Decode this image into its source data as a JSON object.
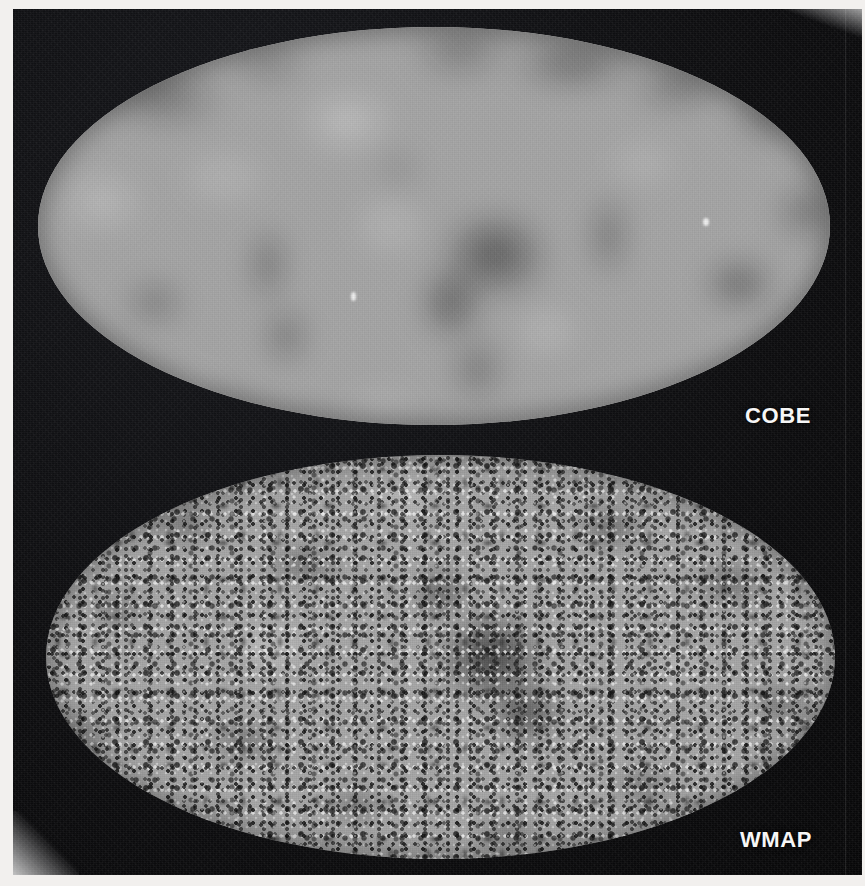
{
  "figure": {
    "width": 865,
    "height": 886,
    "background_color": "#0d0d0e",
    "page_color": "#f2f0ee"
  },
  "maps": [
    {
      "id": "cobe",
      "label": "COBE",
      "projection": "mollweide-ellipse",
      "appearance": "smooth low-resolution blurred grayscale all-sky temperature map",
      "base_color": "#9b9b9b",
      "dark_color": "#4f4f4f",
      "bright_color": "#c2c2c2"
    },
    {
      "id": "wmap",
      "label": "WMAP",
      "projection": "mollweide-ellipse",
      "appearance": "fine-grained high-resolution speckled grayscale all-sky temperature map",
      "base_color": "#a3a3a3",
      "dark_color": "#141414",
      "bright_color": "#ececec"
    }
  ],
  "labels": {
    "cobe": "COBE",
    "wmap": "WMAP",
    "label_color": "#f6f6f6"
  },
  "chart_data": {
    "type": "heatmap",
    "title": "",
    "xlabel": "",
    "ylabel": "",
    "panels": [
      {
        "name": "COBE",
        "projection": "Mollweide full-sky",
        "quantity": "CMB temperature anisotropy",
        "angular_resolution_deg": 7,
        "colormap": "grayscale",
        "note": "large smooth blobs, few degrees-scale structure"
      },
      {
        "name": "WMAP",
        "projection": "Mollweide full-sky",
        "quantity": "CMB temperature anisotropy",
        "angular_resolution_deg": 0.22,
        "colormap": "grayscale",
        "note": "fine-grained speckle with sub-degree structure"
      }
    ],
    "legend_position": "none",
    "grid": false
  }
}
